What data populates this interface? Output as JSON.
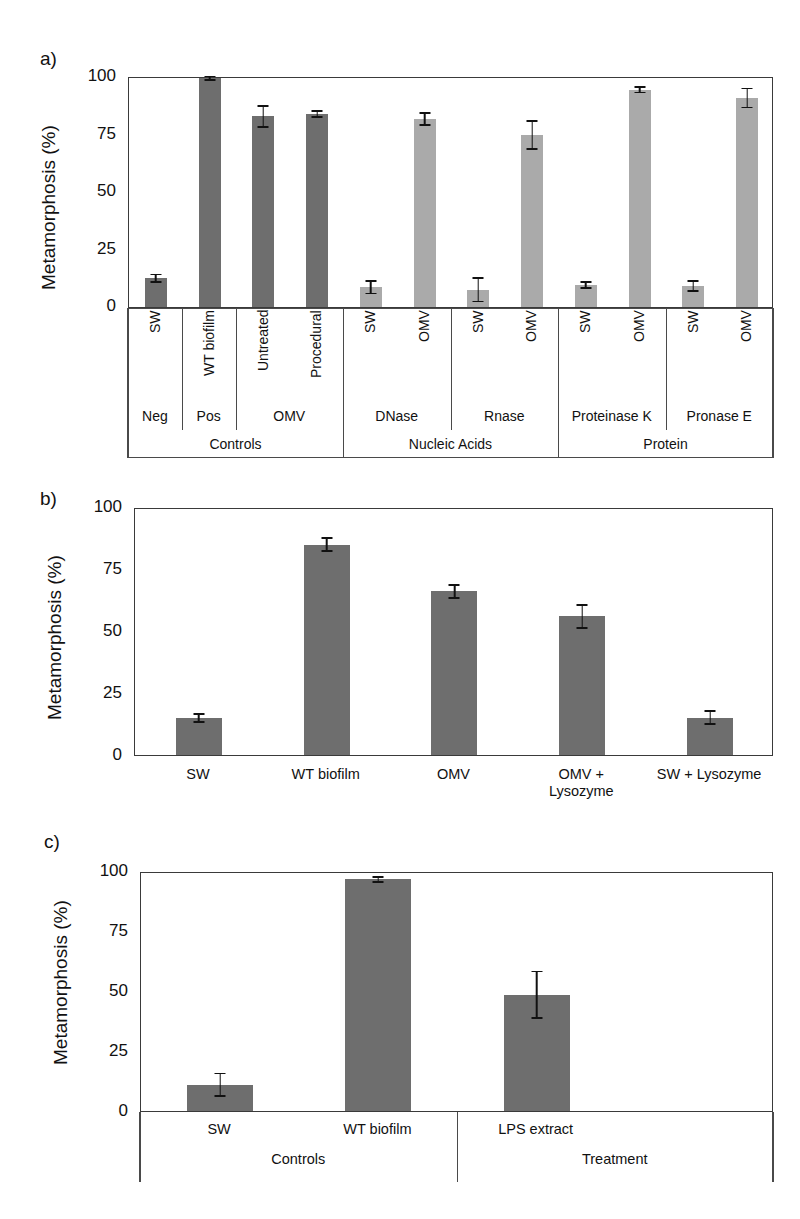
{
  "figure": {
    "panels": [
      "a)",
      "b)",
      "c)"
    ],
    "y_axis_title": "Metamorphosis (%)",
    "y_ticks": [
      "0",
      "25",
      "50",
      "75",
      "100"
    ],
    "colors": {
      "bar_dark": "#6e6e6e",
      "bar_light": "#aaaaaa",
      "axis": "#3a3a3a",
      "error": "#111111"
    }
  },
  "chart_data": [
    {
      "type": "bar",
      "panel": "a)",
      "title": "",
      "xlabel": "",
      "ylabel": "Metamorphosis (%)",
      "ylim": [
        0,
        100
      ],
      "yticks": [
        0,
        25,
        50,
        75,
        100
      ],
      "grid": false,
      "legend": "none",
      "categories": [
        "SW",
        "WT biofilm",
        "Untreated",
        "Procedural",
        "SW",
        "OMV",
        "SW",
        "OMV",
        "SW",
        "OMV",
        "SW",
        "OMV"
      ],
      "values": [
        12.5,
        99.0,
        82.5,
        83.5,
        8.5,
        81.5,
        7.5,
        74.5,
        9.5,
        94.0,
        9.0,
        90.5
      ],
      "errors": [
        2.0,
        1.2,
        5.0,
        1.8,
        3.0,
        3.0,
        5.5,
        6.5,
        1.8,
        1.5,
        2.5,
        4.5
      ],
      "bar_shades": [
        "dark",
        "dark",
        "dark",
        "dark",
        "light",
        "light",
        "light",
        "light",
        "light",
        "light",
        "light",
        "light"
      ],
      "group_level_1": [
        {
          "label": "Neg",
          "span": 1
        },
        {
          "label": "Pos",
          "span": 1
        },
        {
          "label": "OMV",
          "span": 2
        },
        {
          "label": "DNase",
          "span": 2
        },
        {
          "label": "Rnase",
          "span": 2
        },
        {
          "label": "Proteinase K",
          "span": 2
        },
        {
          "label": "Pronase E",
          "span": 2
        }
      ],
      "group_level_2": [
        {
          "label": "Controls",
          "span": 4
        },
        {
          "label": "Nucleic Acids",
          "span": 4
        },
        {
          "label": "Protein",
          "span": 4
        }
      ]
    },
    {
      "type": "bar",
      "panel": "b)",
      "title": "",
      "xlabel": "",
      "ylabel": "Metamorphosis (%)",
      "ylim": [
        0,
        100
      ],
      "yticks": [
        0,
        25,
        50,
        75,
        100
      ],
      "grid": false,
      "legend": "none",
      "categories": [
        "SW",
        "WT biofilm",
        "OMV",
        "OMV +\nLysozyme",
        "SW + Lysozyme"
      ],
      "category_lines": [
        [
          "SW"
        ],
        [
          "WT biofilm"
        ],
        [
          "OMV"
        ],
        [
          "OMV +",
          "Lysozyme"
        ],
        [
          "SW + Lysozyme"
        ]
      ],
      "values": [
        14.8,
        84.8,
        66.0,
        56.0,
        15.0
      ],
      "errors": [
        2.0,
        3.0,
        3.0,
        5.0,
        3.0
      ],
      "bar_shades": [
        "dark",
        "dark",
        "dark",
        "dark",
        "dark"
      ]
    },
    {
      "type": "bar",
      "panel": "c)",
      "title": "",
      "xlabel": "",
      "ylabel": "Metamorphosis (%)",
      "ylim": [
        0,
        100
      ],
      "yticks": [
        0,
        25,
        50,
        75,
        100
      ],
      "grid": false,
      "legend": "none",
      "categories": [
        "SW",
        "WT biofilm",
        "LPS extract"
      ],
      "values": [
        11.0,
        96.5,
        48.5,
        0
      ],
      "errors": [
        5.0,
        1.5,
        10.0
      ],
      "bar_shades": [
        "dark",
        "dark",
        "dark"
      ],
      "group_level_1": [
        {
          "label": "Controls",
          "span": 2
        },
        {
          "label": "Treatment",
          "span": 1
        }
      ]
    }
  ]
}
